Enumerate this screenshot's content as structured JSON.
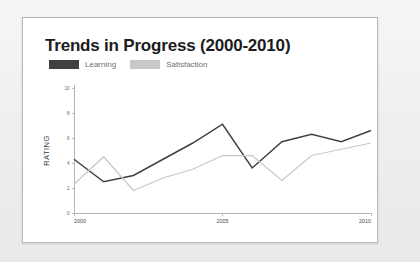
{
  "slide": {
    "title": "Trends in Progress (2000-2010)"
  },
  "legend": {
    "position": "top-left",
    "items": [
      {
        "label": "Learning",
        "color": "#404040",
        "swatch_name": "legend-swatch-learning"
      },
      {
        "label": "Satisfaction",
        "color": "#c8c8c8",
        "swatch_name": "legend-swatch-satisfaction"
      }
    ]
  },
  "axes": {
    "y_title": "RATING",
    "y_ticks": [
      "0",
      "2",
      "4",
      "6",
      "8",
      "10"
    ],
    "x_ticks": [
      "2000",
      "2005",
      "2010"
    ]
  },
  "colors": {
    "learning": "#404040",
    "satisfaction": "#c8c8c8",
    "axis": "#b5b5b5",
    "card_border": "#b9b9b9",
    "page_background": "#f2f2f2",
    "card_background": "#ffffff",
    "title_text": "#1c1c1c",
    "legend_text": "#6f6f6f"
  },
  "chart_data": {
    "type": "line",
    "title": "Trends in Progress (2000-2010)",
    "xlabel": "",
    "ylabel": "RATING",
    "xlim": [
      2000,
      2010
    ],
    "ylim": [
      0,
      10
    ],
    "yticks": [
      0,
      2,
      4,
      6,
      8,
      10
    ],
    "xticks": [
      2000,
      2005,
      2010
    ],
    "grid": false,
    "legend_position": "top-left",
    "x": [
      2000,
      2001,
      2002,
      2003,
      2004,
      2005,
      2006,
      2007,
      2008,
      2009,
      2010
    ],
    "series": [
      {
        "name": "Learning",
        "color": "#404040",
        "values": [
          4.3,
          2.5,
          3.0,
          4.3,
          5.6,
          7.1,
          3.6,
          5.7,
          6.3,
          5.7,
          6.6
        ]
      },
      {
        "name": "Satisfaction",
        "color": "#c8c8c8",
        "values": [
          2.3,
          4.5,
          1.8,
          2.8,
          3.5,
          4.6,
          4.6,
          2.6,
          4.6,
          5.1,
          5.6
        ]
      }
    ]
  }
}
